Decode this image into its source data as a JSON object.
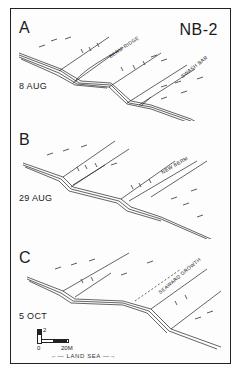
{
  "figure": {
    "title": "NB-2",
    "panels": [
      {
        "letter": "A",
        "date": "8 AUG",
        "labels": [
          {
            "text": "BERM-RIDGE"
          },
          {
            "text": "SWASH BAR"
          }
        ]
      },
      {
        "letter": "B",
        "date": "29 AUG",
        "labels": [
          {
            "text": "NEW BERM"
          }
        ]
      },
      {
        "letter": "C",
        "date": "5 OCT",
        "labels": [
          {
            "text": "SEAWARD GROWTH"
          }
        ]
      }
    ],
    "scale": {
      "vertical_value": "2",
      "origin_value": "0",
      "horizontal_value": "20M"
    },
    "orientation": {
      "left_label": "LAND",
      "right_label": "SEA",
      "text": "←— LAND  SEA —→"
    }
  }
}
